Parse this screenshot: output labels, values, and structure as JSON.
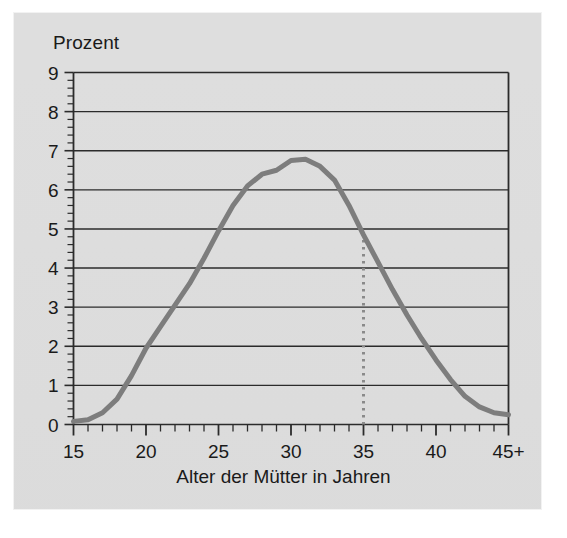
{
  "chart_data": {
    "type": "line",
    "title": "",
    "xlabel": "Alter der Mütter in Jahren",
    "ylabel": "Prozent",
    "ylim": [
      0,
      9
    ],
    "xlim": [
      15,
      45
    ],
    "grid": true,
    "legend": "none",
    "y_ticks": [
      "0",
      "1",
      "2",
      "3",
      "4",
      "5",
      "6",
      "7",
      "8",
      "9"
    ],
    "y_tick_values": [
      0,
      1,
      2,
      3,
      4,
      5,
      6,
      7,
      8,
      9
    ],
    "y_minor_ticks_per_unit": 5,
    "x_ticks": [
      "15",
      "20",
      "25",
      "30",
      "35",
      "40",
      "45+"
    ],
    "x_tick_values": [
      15,
      20,
      25,
      30,
      35,
      40,
      45
    ],
    "x_minor_tick_step": 1,
    "series": [
      {
        "name": "Anteil Geburten nach Alter der Mutter",
        "color": "#7d7d7d",
        "x": [
          15,
          16,
          17,
          18,
          19,
          20,
          21,
          22,
          23,
          24,
          25,
          26,
          27,
          28,
          29,
          30,
          31,
          32,
          33,
          34,
          35,
          36,
          37,
          38,
          39,
          40,
          41,
          42,
          43,
          44,
          45
        ],
        "values": [
          0.08,
          0.12,
          0.3,
          0.65,
          1.25,
          1.95,
          2.5,
          3.05,
          3.6,
          4.25,
          4.95,
          5.6,
          6.1,
          6.4,
          6.5,
          6.75,
          6.78,
          6.6,
          6.25,
          5.6,
          4.85,
          4.15,
          3.45,
          2.8,
          2.2,
          1.65,
          1.15,
          0.72,
          0.45,
          0.3,
          0.25
        ]
      }
    ],
    "annotations": [
      {
        "name": "marker-line-age-35",
        "type": "vertical-dotted-line",
        "x": 35,
        "y_from": 0,
        "y_to": 4.85,
        "color": "#8a8a8a"
      }
    ]
  },
  "axes": {
    "y_axis_title": "Prozent",
    "x_axis_title": "Alter der Mütter in Jahren"
  }
}
